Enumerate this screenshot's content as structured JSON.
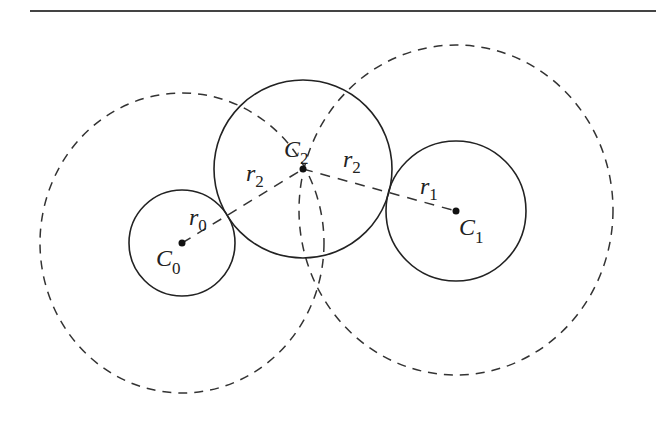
{
  "diagram": {
    "type": "tangent-circles-construction",
    "top_rule": {
      "x1": 30,
      "x2": 656,
      "y": 11
    },
    "circles": [
      {
        "id": "C0",
        "label": "C",
        "sub": "0",
        "radius_label": "r",
        "radius_sub": "0",
        "cx": 182,
        "cy": 243,
        "r": 53,
        "style": "solid"
      },
      {
        "id": "C1",
        "label": "C",
        "sub": "1",
        "radius_label": "r",
        "radius_sub": "1",
        "cx": 456,
        "cy": 211,
        "r": 70,
        "style": "solid"
      },
      {
        "id": "C2",
        "label": "C",
        "sub": "2",
        "radius_label": "r",
        "radius_sub": "2",
        "cx": 303,
        "cy": 169,
        "r": 89,
        "style": "solid"
      }
    ],
    "dashed_circles": [
      {
        "id": "locus-around-C0",
        "center": "C0",
        "radius_expr": "r0 + r2",
        "cx": 182,
        "cy": 243,
        "rx": 142,
        "ry": 150
      },
      {
        "id": "locus-around-C1",
        "center": "C1",
        "radius_expr": "r1 + r2",
        "cx": 456,
        "cy": 210,
        "rx": 157,
        "ry": 165
      }
    ],
    "dashed_segments": [
      {
        "from": "C0",
        "to": "C2"
      },
      {
        "from": "C2",
        "to": "C1"
      }
    ],
    "labels": {
      "c0": {
        "main": "C",
        "sub": "0"
      },
      "c1": {
        "main": "C",
        "sub": "1"
      },
      "c2": {
        "main": "C",
        "sub": "2"
      },
      "r0": {
        "main": "r",
        "sub": "0"
      },
      "r1": {
        "main": "r",
        "sub": "1"
      },
      "r2_left": {
        "main": "r",
        "sub": "2"
      },
      "r2_right": {
        "main": "r",
        "sub": "2"
      }
    }
  }
}
